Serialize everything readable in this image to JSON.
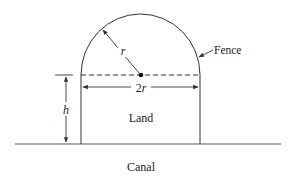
{
  "diagram": {
    "type": "geometry-figure",
    "labels": {
      "fence": "Fence",
      "land": "Land",
      "canal": "Canal",
      "radius": "r",
      "width": "2r",
      "height": "h"
    },
    "colors": {
      "stroke": "#333333",
      "text": "#222222",
      "background": "#ffffff"
    }
  }
}
